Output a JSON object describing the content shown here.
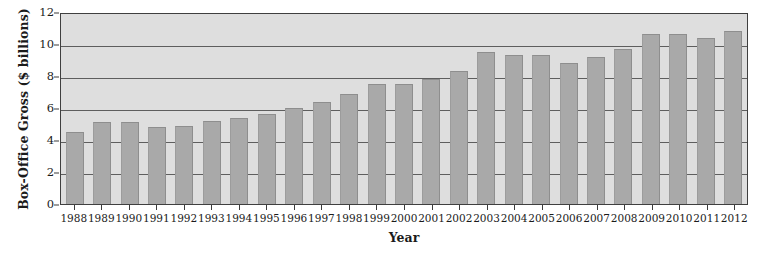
{
  "chart_data": {
    "type": "bar",
    "title": "",
    "xlabel": "Year",
    "ylabel": "Box-Office Gross ($ billions)",
    "categories": [
      "1988",
      "1989",
      "1990",
      "1991",
      "1992",
      "1993",
      "1994",
      "1995",
      "1996",
      "1997",
      "1998",
      "1999",
      "2000",
      "2001",
      "2002",
      "2003",
      "2004",
      "2005",
      "2006",
      "2007",
      "2008",
      "2009",
      "2010",
      "2011",
      "2012"
    ],
    "values": [
      4.5,
      5.1,
      5.1,
      4.8,
      4.9,
      5.2,
      5.4,
      5.6,
      6.0,
      6.4,
      6.9,
      7.5,
      7.5,
      7.8,
      8.3,
      9.5,
      9.3,
      9.3,
      8.8,
      9.2,
      9.7,
      10.6,
      10.6,
      10.4,
      10.8
    ],
    "ylim": [
      0,
      12
    ],
    "yticks": [
      0,
      2,
      4,
      6,
      8,
      10,
      12
    ],
    "ytick_labels": [
      "0",
      "2",
      "4",
      "6",
      "8",
      "10",
      "12"
    ],
    "gridlines": [
      2,
      4,
      6,
      8,
      10
    ],
    "grid": true,
    "legend": "none",
    "colors": {
      "bar_fill": "#a9a9a9",
      "bar_edge": "#8e8e8e",
      "plot_background": "#dedede",
      "gridline": "#5e5e5e",
      "axis": "#3f3f3f",
      "text": "#1b1b1b",
      "page_background": "#ffffff"
    }
  }
}
